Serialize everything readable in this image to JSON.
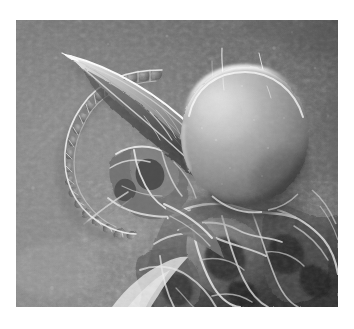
{
  "document": {
    "kind": "scientific-micrograph",
    "background_color": "#ffffff",
    "caption": "",
    "label": "",
    "scale_bar_text": ""
  },
  "figure": {
    "name": "sem-micrograph",
    "alt_text": "Scanning electron micrograph of an arthropod head showing a large smooth spherical bulb, a long tapered curved horn, a beaded segmented antenna and folded cuticular tissue",
    "frame": {
      "x": 16,
      "y": 20,
      "width": 322,
      "height": 287
    },
    "modality": "scanning-electron-microscope",
    "rendering": "grayscale",
    "border": "none"
  },
  "palette": {
    "paper_white": "#ffffff",
    "background_gray_light": "#858585",
    "background_gray_mid": "#767676",
    "background_gray_dark": "#5f5f5f",
    "bulb_highlight": "#e8e8e8",
    "bulb_midtone": "#9a9a9a",
    "bulb_shadow": "#4a4a4a",
    "horn_highlight": "#f2f2f2",
    "horn_shadow": "#3c3c3c",
    "tissue_highlight": "#efefef",
    "tissue_shadow": "#2b2b2b",
    "deep_shadow": "#1c1c1c",
    "seta_color": "#f6f6f6"
  },
  "structures": [
    {
      "id": "bulb",
      "name": "spherical-bulb",
      "description": "Large smooth sphere, brightest rim along upper-left and top edge, shading to dark at lower right",
      "center": {
        "x": 245,
        "y": 136
      },
      "radius_x": 64,
      "radius_y": 69,
      "tone": "light-gray"
    },
    {
      "id": "horn",
      "name": "tapered-horn",
      "description": "Long curved cone tapering to a sharp point at the upper left, attached to the bulb neck",
      "tip": {
        "x": 70,
        "y": 56
      },
      "base": {
        "x": 196,
        "y": 152
      },
      "tone": "mid-gray-with-bright-edge"
    },
    {
      "id": "antenna",
      "name": "beaded-antenna",
      "description": "Chain of rounded segments forming an open loop curving down and left from the horn base",
      "segment_count": 22,
      "tone": "mid-gray-outlined"
    },
    {
      "id": "setae",
      "name": "setae-hairs",
      "description": "Two fine bright hairs projecting upward from the top of the bulb",
      "count": 2
    },
    {
      "id": "cuticle",
      "name": "folded-cuticle",
      "description": "Complex folded and ridged cuticular tissue filling the lower right of the frame",
      "tone": "dark-gray-with-bright-ridges"
    },
    {
      "id": "substrate",
      "name": "granular-substrate",
      "description": "Fine granular background surface, lighter at left, darker at upper right",
      "tone": "mid-gray-granular"
    }
  ]
}
